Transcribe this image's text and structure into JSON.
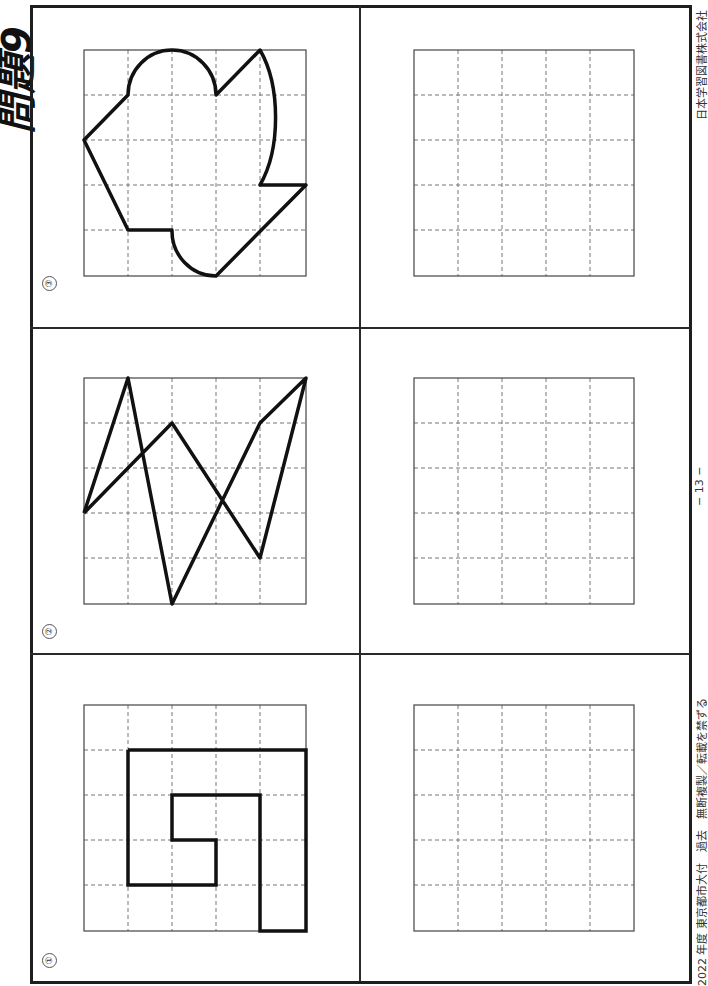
{
  "title": "問題9",
  "footer": {
    "source_note": "2022 年度 東京都市大付　過去　無断複製／転載を禁ずる",
    "page_number": "− 13 −",
    "publisher": "日本学習図書株式会社"
  },
  "grid": {
    "rows": 5,
    "cols": 5,
    "cell_px": 44
  },
  "problems": [
    {
      "number": "①",
      "label": "problem-1",
      "figure": "spiral-rectilinear-polyline",
      "points": [
        [
          1,
          1
        ],
        [
          5,
          1
        ],
        [
          5,
          5
        ],
        [
          4,
          5
        ],
        [
          4,
          2
        ],
        [
          2,
          2
        ],
        [
          2,
          3
        ],
        [
          3,
          3
        ],
        [
          3,
          4
        ],
        [
          1,
          4
        ],
        [
          1,
          1
        ]
      ]
    },
    {
      "number": "②",
      "label": "problem-2",
      "figure": "zigzag-polyline",
      "points": [
        [
          0,
          3
        ],
        [
          1,
          0
        ],
        [
          2,
          5
        ],
        [
          4,
          1
        ],
        [
          5,
          0
        ],
        [
          4,
          4
        ],
        [
          2,
          1
        ],
        [
          0,
          3
        ]
      ]
    },
    {
      "number": "③",
      "label": "problem-3",
      "figure": "closed-shape-with-arcs"
    }
  ],
  "answer_grids": [
    {
      "label": "answer-grid-1"
    },
    {
      "label": "answer-grid-2"
    },
    {
      "label": "answer-grid-3"
    }
  ]
}
